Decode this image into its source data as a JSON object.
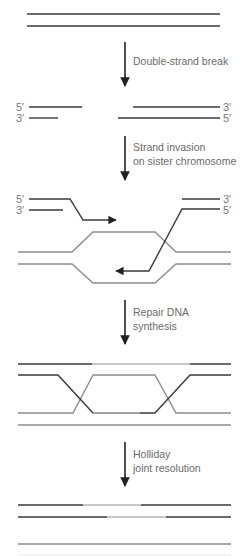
{
  "diagram": {
    "colors": {
      "dark_strand": "#3a3a3a",
      "gray_strand": "#8c8c8c",
      "light_strand": "#b5b5b5",
      "arrow": "#222222",
      "text": "#6a6a6a"
    },
    "steps": [
      {
        "label_line1": "Double-strand break",
        "label_line2": ""
      },
      {
        "label_line1": "Strand invasion",
        "label_line2": "on sister chromosome"
      },
      {
        "label_line1": "Repair DNA",
        "label_line2": "synthesis"
      },
      {
        "label_line1": "Holliday",
        "label_line2": "joint resolution"
      }
    ],
    "end_labels": {
      "five_prime": "5′",
      "three_prime": "3′"
    }
  }
}
